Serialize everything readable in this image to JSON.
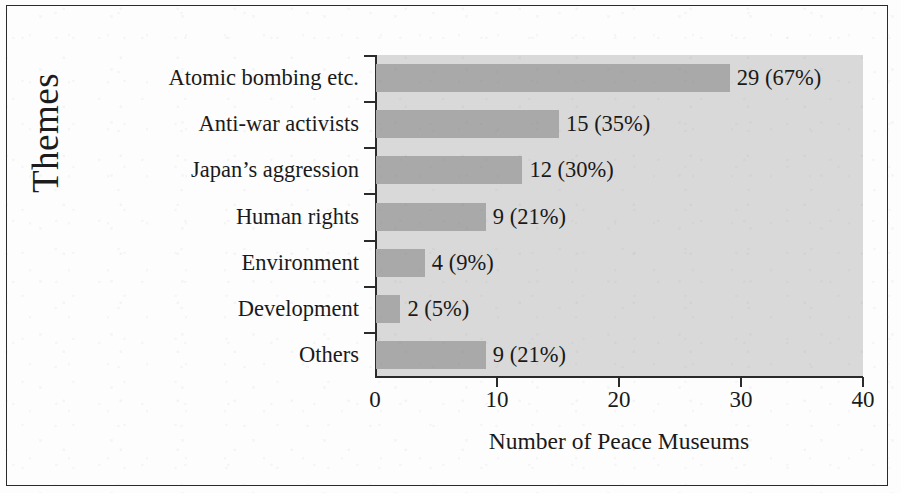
{
  "chart_data": {
    "type": "bar",
    "orientation": "horizontal",
    "title": "",
    "xlabel": "Number of Peace Museums",
    "ylabel": "Themes",
    "xlim": [
      0,
      40
    ],
    "xticks": [
      0,
      10,
      20,
      30,
      40
    ],
    "xtick_labels": [
      "0",
      "10",
      "20",
      "30",
      "40"
    ],
    "grid": false,
    "legend": null,
    "categories": [
      "Atomic bombing etc.",
      "Anti-war activists",
      "Japan’s aggression",
      "Human rights",
      "Environment",
      "Development",
      "Others"
    ],
    "values": [
      29,
      15,
      12,
      9,
      4,
      2,
      9
    ],
    "percentages": [
      "67%",
      "35%",
      "30%",
      "21%",
      "9%",
      "5%",
      "21%"
    ],
    "data_labels": [
      "29 (67%)",
      "15 (35%)",
      "12 (30%)",
      "9 (21%)",
      "4 (9%)",
      "2 (5%)",
      "9 (21%)"
    ],
    "colors": {
      "bar": "#a9a9a9",
      "plot_background": "#d9d9d9",
      "axis": "#2b2b2b",
      "text": "#1a1a1a",
      "page_background": "#fdfdfd",
      "frame": "#2a2a2a"
    }
  }
}
